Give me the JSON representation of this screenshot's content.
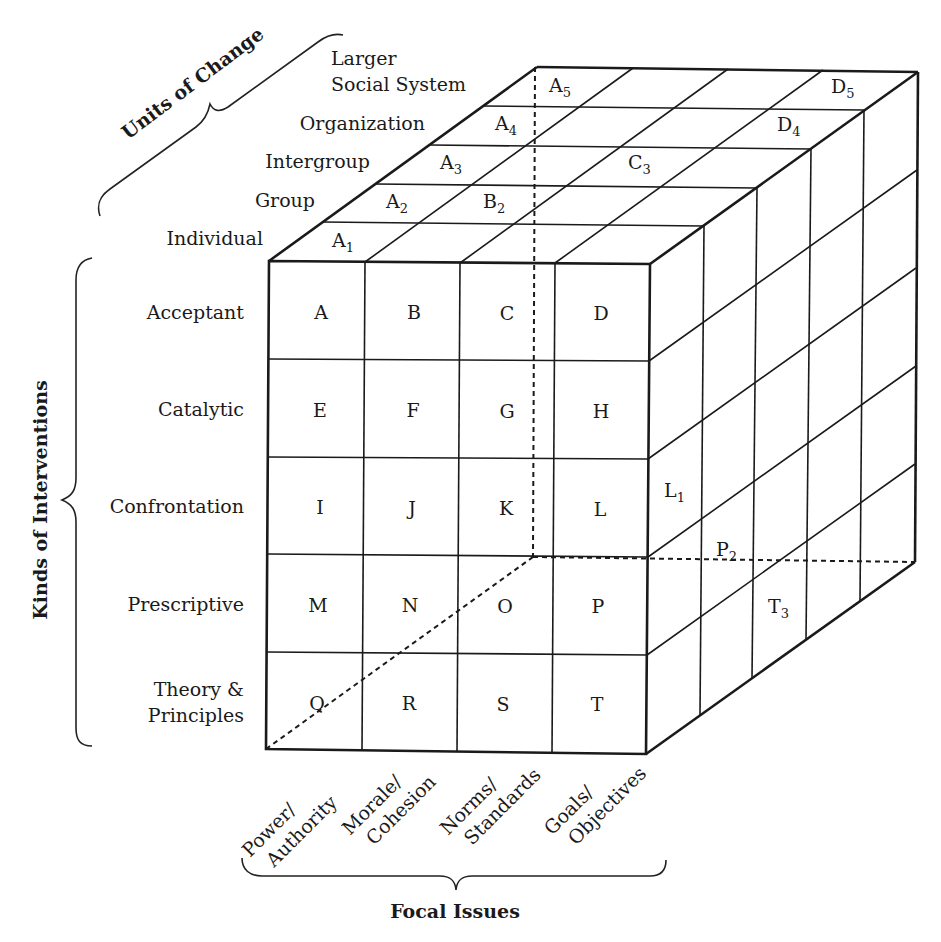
{
  "diagram": {
    "axes": {
      "units_of_change": {
        "title": "Units of Change",
        "levels": [
          "Individual",
          "Group",
          "Intergroup",
          "Organization",
          "Larger",
          "Social System"
        ]
      },
      "kinds_of_interventions": {
        "title": "Kinds of Interventions",
        "levels": [
          "Acceptant",
          "Catalytic",
          "Confrontation",
          "Prescriptive",
          "Theory &",
          "Principles"
        ]
      },
      "focal_issues": {
        "title": "Focal Issues",
        "levels": [
          {
            "line1": "Power/",
            "line2": "Authority"
          },
          {
            "line1": "Morale/",
            "line2": "Cohesion"
          },
          {
            "line1": "Norms/",
            "line2": "Standards"
          },
          {
            "line1": "Goals/",
            "line2": "Objectives"
          }
        ]
      }
    },
    "front_cells": [
      [
        "A",
        "B",
        "C",
        "D"
      ],
      [
        "E",
        "F",
        "G",
        "H"
      ],
      [
        "I",
        "J",
        "K",
        "L"
      ],
      [
        "M",
        "N",
        "O",
        "P"
      ],
      [
        "Q",
        "R",
        "S",
        "T"
      ]
    ],
    "top_cells": [
      {
        "letter": "A",
        "sub": "1"
      },
      {
        "letter": "A",
        "sub": "2"
      },
      {
        "letter": "B",
        "sub": "2"
      },
      {
        "letter": "A",
        "sub": "3"
      },
      {
        "letter": "C",
        "sub": "3"
      },
      {
        "letter": "A",
        "sub": "4"
      },
      {
        "letter": "D",
        "sub": "4"
      },
      {
        "letter": "A",
        "sub": "5"
      },
      {
        "letter": "D",
        "sub": "5"
      }
    ],
    "side_cells": [
      {
        "letter": "L",
        "sub": "1"
      },
      {
        "letter": "P",
        "sub": "2"
      },
      {
        "letter": "T",
        "sub": "3"
      }
    ]
  }
}
